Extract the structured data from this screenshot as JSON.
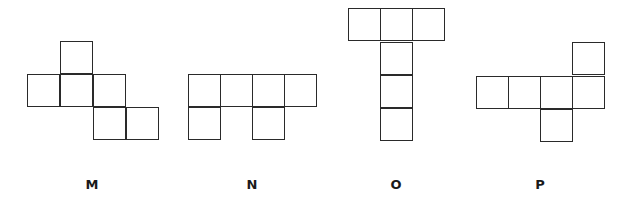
{
  "figure": {
    "cell_size": 33,
    "line_color": "#2a2a2a",
    "shapes": [
      {
        "label": "M",
        "label_x": 92,
        "cells": [
          [
            60,
            41
          ],
          [
            27,
            74
          ],
          [
            60,
            74
          ],
          [
            93,
            74
          ],
          [
            93,
            107
          ],
          [
            126,
            107
          ]
        ]
      },
      {
        "label": "N",
        "label_x": 252,
        "cells": [
          [
            188,
            74
          ],
          [
            220,
            74
          ],
          [
            252,
            74
          ],
          [
            284,
            74
          ],
          [
            188,
            107
          ],
          [
            252,
            107
          ]
        ]
      },
      {
        "label": "O",
        "label_x": 396,
        "cells": [
          [
            348,
            8
          ],
          [
            380,
            8
          ],
          [
            412,
            8
          ],
          [
            380,
            42
          ],
          [
            380,
            75
          ],
          [
            380,
            108
          ]
        ]
      },
      {
        "label": "P",
        "label_x": 540,
        "cells": [
          [
            572,
            42
          ],
          [
            476,
            76
          ],
          [
            508,
            76
          ],
          [
            540,
            76
          ],
          [
            572,
            76
          ],
          [
            540,
            109
          ]
        ]
      }
    ]
  }
}
